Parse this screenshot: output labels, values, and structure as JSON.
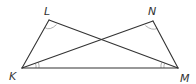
{
  "diagram": {
    "type": "geometry",
    "vertices": {
      "L": {
        "label": "L",
        "x": 49,
        "y": 20
      },
      "N": {
        "label": "N",
        "x": 153,
        "y": 21
      },
      "K": {
        "label": "K",
        "x": 22,
        "y": 68
      },
      "M": {
        "label": "M",
        "x": 178,
        "y": 68
      }
    },
    "segments": [
      "KL",
      "LM",
      "KN",
      "NM",
      "KM"
    ],
    "angle_marks": [
      {
        "vertex": "L",
        "marks": 1,
        "between": [
          "K",
          "M"
        ]
      },
      {
        "vertex": "N",
        "marks": 1,
        "between": [
          "K",
          "M"
        ]
      },
      {
        "vertex": "K",
        "marks": 2,
        "between": [
          "N",
          "M"
        ]
      },
      {
        "vertex": "M",
        "marks": 2,
        "between": [
          "L",
          "K"
        ]
      }
    ],
    "colors": {
      "line": "#333333",
      "arc": "#999999",
      "label": "#333333"
    }
  }
}
